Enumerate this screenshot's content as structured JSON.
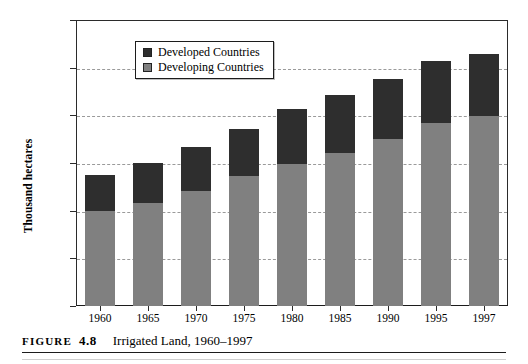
{
  "figure": {
    "caption_figure_word": "FIGURE",
    "caption_number": "4.8",
    "caption_title": "Irrigated Land, 1960–1997"
  },
  "legend": {
    "position": "top-center-inside",
    "items": [
      {
        "label": "Developed Countries",
        "color": "#2e2e2e"
      },
      {
        "label": "Developing Countries",
        "color": "#808080"
      }
    ]
  },
  "axis": {
    "ylabel": "Thousand hectares",
    "yticks": [
      "0",
      "50000",
      "100000",
      "150000",
      "200000",
      "250000",
      "300000"
    ],
    "xticks": [
      "1960",
      "1965",
      "1970",
      "1975",
      "1980",
      "1985",
      "1990",
      "1995",
      "1997"
    ]
  },
  "chart_data": {
    "type": "bar",
    "stacked": true,
    "title": "Irrigated Land, 1960–1997",
    "xlabel": "",
    "ylabel": "Thousand hectares",
    "ylim": [
      0,
      300000
    ],
    "ytick_values": [
      0,
      50000,
      100000,
      150000,
      200000,
      250000,
      300000
    ],
    "grid": true,
    "grid_axis": "y",
    "legend": "inside-top-center",
    "categories": [
      "1960",
      "1965",
      "1970",
      "1975",
      "1980",
      "1985",
      "1990",
      "1995",
      "1997"
    ],
    "series": [
      {
        "name": "Developing Countries",
        "color": "#808080",
        "values": [
          100000,
          108000,
          121000,
          136000,
          149000,
          160000,
          175000,
          192000,
          199000
        ]
      },
      {
        "name": "Developed Countries",
        "color": "#2e2e2e",
        "values": [
          37000,
          42000,
          46000,
          50000,
          58000,
          61000,
          63000,
          65000,
          65000
        ]
      }
    ],
    "totals": [
      137000,
      150000,
      167000,
      186000,
      207000,
      221000,
      238000,
      257000,
      264000
    ]
  }
}
